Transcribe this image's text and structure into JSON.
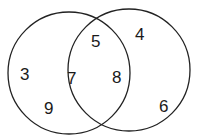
{
  "diagram": {
    "type": "venn",
    "sets": [
      {
        "name": "left",
        "circle": {
          "cx": 69,
          "cy": 73,
          "r": 61
        }
      },
      {
        "name": "right",
        "circle": {
          "cx": 129,
          "cy": 70,
          "r": 61
        }
      }
    ],
    "stroke_color": "#222222",
    "regions": {
      "left_only": [
        "3",
        "9"
      ],
      "intersection": [
        "5",
        "7",
        "8"
      ],
      "right_only": [
        "4",
        "6"
      ]
    },
    "labels": [
      {
        "text": "3",
        "x": 28,
        "y": 80,
        "region": "left_only"
      },
      {
        "text": "9",
        "x": 50,
        "y": 114,
        "region": "left_only"
      },
      {
        "text": "5",
        "x": 96,
        "y": 46,
        "region": "intersection"
      },
      {
        "text": "7",
        "x": 75,
        "y": 83,
        "region": "intersection"
      },
      {
        "text": "8",
        "x": 118,
        "y": 82,
        "region": "intersection"
      },
      {
        "text": "4",
        "x": 141,
        "y": 40,
        "region": "right_only"
      },
      {
        "text": "6",
        "x": 162,
        "y": 110,
        "region": "right_only"
      }
    ]
  }
}
